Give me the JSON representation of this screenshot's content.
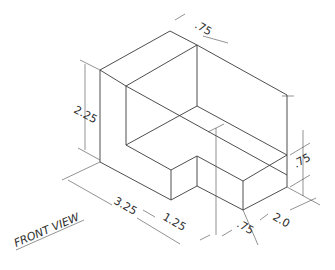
{
  "drawing": {
    "type": "isometric-technical-drawing",
    "view_label": "FRONT VIEW",
    "line_color": "#3a3a3a",
    "background": "#ffffff",
    "dimensions": {
      "height_total": "2.25",
      "top_depth": ".75",
      "step_height": ".75",
      "overall_length": "3.25",
      "front_segment": "1.25",
      "notch_width": ".75",
      "width": "2.0"
    }
  }
}
